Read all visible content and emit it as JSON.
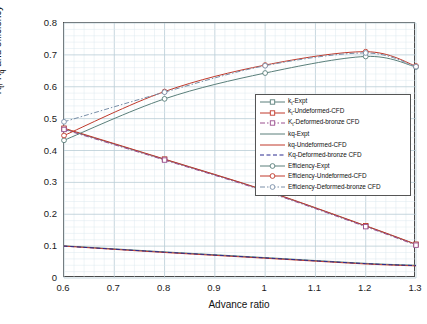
{
  "axes": {
    "xlabel": "Advance ratio",
    "ylabel_parts": {
      "a": "K",
      "a_sub": "t",
      "b": ", K",
      "b_sub": "q",
      "c": " and efficiency"
    },
    "ylabel_text": "Kt, Kq and efficiency",
    "xticks": [
      "0.6",
      "0.7",
      "0.8",
      "0.9",
      "1",
      "1.1",
      "1.2",
      "1.3"
    ],
    "yticks": [
      "0",
      "0.1",
      "0.2",
      "0.3",
      "0.4",
      "0.5",
      "0.6",
      "0.7",
      "0.8"
    ]
  },
  "legend": {
    "entries": [
      {
        "label": "k",
        "sub": "t",
        "suffix": "-Expt",
        "color": "#5a7f7a",
        "dash": "none",
        "marker": "square"
      },
      {
        "label": "k",
        "sub": "t",
        "suffix": "-Undeformed-CFD",
        "color": "#c0392b",
        "dash": "none",
        "marker": "square"
      },
      {
        "label": "K",
        "sub": "t",
        "suffix": "-Deformed-bronze CFD",
        "color": "#9a4f8f",
        "dash": "dashdot",
        "marker": "square"
      },
      {
        "label": "kq",
        "sub": "",
        "suffix": "-Expt",
        "color": "#5a7f7a",
        "dash": "none",
        "marker": "none"
      },
      {
        "label": "kq",
        "sub": "",
        "suffix": "-Undeformed-CFD",
        "color": "#c0392b",
        "dash": "none",
        "marker": "none"
      },
      {
        "label": "Kq",
        "sub": "",
        "suffix": "-Deformed-bronze CFD",
        "color": "#2b2b8f",
        "dash": "dash",
        "marker": "none"
      },
      {
        "label": "Efficiency",
        "sub": "",
        "suffix": "-Expt",
        "color": "#5a7f7a",
        "dash": "none",
        "marker": "circle"
      },
      {
        "label": "Efficiency",
        "sub": "",
        "suffix": "-Undeformed-CFD",
        "color": "#c0392b",
        "dash": "none",
        "marker": "circle"
      },
      {
        "label": "Efficiency",
        "sub": "",
        "suffix": "-Deformed-bronze CFD",
        "color": "#7a8fa8",
        "dash": "dashdot",
        "marker": "circle"
      }
    ]
  },
  "chart_data": {
    "type": "line",
    "title": "",
    "xlabel": "Advance ratio",
    "ylabel": "Kt, Kq and efficiency",
    "xlim": [
      0.6,
      1.3
    ],
    "ylim": [
      0,
      0.8
    ],
    "grid": true,
    "legend_position": "center-right",
    "x": [
      0.6,
      0.8,
      1.0,
      1.2,
      1.3
    ],
    "series": [
      {
        "name": "kt-Expt",
        "color": "#5a7f7a",
        "dash": "none",
        "marker": "square",
        "values": [
          0.468,
          0.372,
          0.274,
          0.163,
          0.105
        ]
      },
      {
        "name": "kt-Undeformed-CFD",
        "color": "#c0392b",
        "dash": "none",
        "marker": "square",
        "values": [
          0.47,
          0.373,
          0.275,
          0.164,
          0.106
        ]
      },
      {
        "name": "Kt-Deformed-bronze CFD",
        "color": "#9a4f8f",
        "dash": "dashdot",
        "marker": "square",
        "values": [
          0.466,
          0.37,
          0.272,
          0.161,
          0.103
        ]
      },
      {
        "name": "kq-Expt",
        "color": "#5a7f7a",
        "dash": "none",
        "marker": "none",
        "values": [
          0.101,
          0.082,
          0.064,
          0.046,
          0.04
        ]
      },
      {
        "name": "kq-Undeformed-CFD",
        "color": "#c0392b",
        "dash": "none",
        "marker": "none",
        "values": [
          0.1,
          0.08,
          0.062,
          0.044,
          0.038
        ]
      },
      {
        "name": "Kq-Deformed-bronze CFD",
        "color": "#2b2b8f",
        "dash": "dash",
        "marker": "none",
        "values": [
          0.1,
          0.081,
          0.063,
          0.045,
          0.039
        ]
      },
      {
        "name": "Efficiency-Expt",
        "color": "#5a7f7a",
        "dash": "none",
        "marker": "circle",
        "values": [
          0.432,
          0.562,
          0.643,
          0.695,
          0.662
        ]
      },
      {
        "name": "Efficiency-Undeformed-CFD",
        "color": "#c0392b",
        "dash": "none",
        "marker": "circle",
        "values": [
          0.447,
          0.585,
          0.668,
          0.71,
          0.665
        ]
      },
      {
        "name": "Efficiency-Deformed-bronze CFD",
        "color": "#7a8fa8",
        "dash": "dashdot",
        "marker": "circle",
        "values": [
          0.49,
          0.583,
          0.666,
          0.706,
          0.663
        ]
      }
    ]
  }
}
